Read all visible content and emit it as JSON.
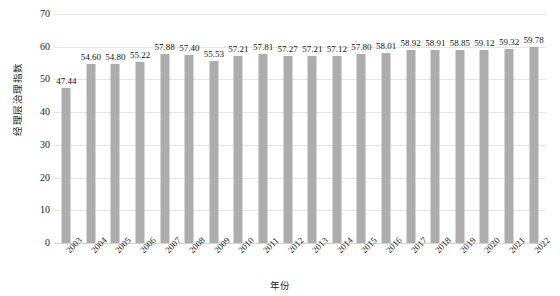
{
  "chart_data": {
    "type": "bar",
    "title": "",
    "xlabel": "年份",
    "ylabel": "经理层治理指数",
    "categories": [
      "2003",
      "2004",
      "2005",
      "2006",
      "2007",
      "2008",
      "2009",
      "2010",
      "2011",
      "2012",
      "2013",
      "2014",
      "2015",
      "2016",
      "2017",
      "2018",
      "2019",
      "2020",
      "2021",
      "2022"
    ],
    "values": [
      47.44,
      54.6,
      54.8,
      55.22,
      57.88,
      57.4,
      55.53,
      57.21,
      57.81,
      57.27,
      57.21,
      57.12,
      57.8,
      58.01,
      58.92,
      58.91,
      58.85,
      59.12,
      59.32,
      59.78
    ],
    "data_labels": [
      "47.44",
      "54.60",
      "54.80",
      "55.22",
      "57.88",
      "57.40",
      "55.53",
      "57.21",
      "57.81",
      "57.27",
      "57.21",
      "57.12",
      "57.80",
      "58.01",
      "58.92",
      "58.91",
      "58.85",
      "59.12",
      "59.32",
      "59.78"
    ],
    "ylim": [
      0,
      70
    ],
    "ytick_values": [
      0,
      10,
      20,
      30,
      40,
      50,
      60,
      70
    ],
    "ytick_labels": [
      "0",
      "10",
      "20",
      "30",
      "40",
      "50",
      "60",
      "70"
    ],
    "grid": true,
    "legend": "none",
    "series_name": "经理层治理指数",
    "bar_color": "#adadad",
    "gridline_color": "#e4e4e4",
    "background_color": "#ffffff"
  }
}
